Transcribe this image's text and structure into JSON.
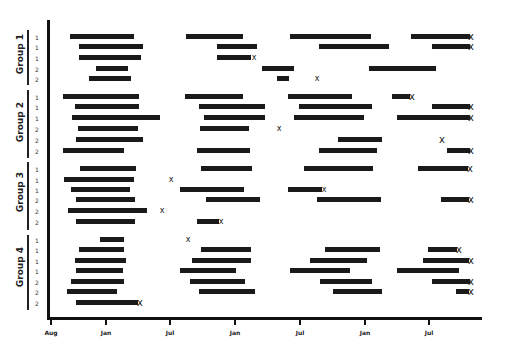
{
  "chart_data": {
    "type": "timeline",
    "title": "",
    "xlabel": "",
    "ylabel": "",
    "x_ticks": [
      {
        "label": "Aug",
        "x": 51
      },
      {
        "label": "Jan",
        "x": 106
      },
      {
        "label": "Jul",
        "x": 170
      },
      {
        "label": "Jan",
        "x": 235
      },
      {
        "label": "Jul",
        "x": 300
      },
      {
        "label": "Jan",
        "x": 365
      },
      {
        "label": "Jul",
        "x": 429
      }
    ],
    "legend": "bars = periods of observation/treatment; x = event (end of follow-up / death)",
    "groups": [
      {
        "label": "Group 1",
        "label_y": 55,
        "line": {
          "top": 30,
          "bottom": 85
        },
        "rows": [
          {
            "y": 37,
            "marker": "1",
            "bars": [
              [
                70,
                134
              ],
              [
                186,
                243
              ],
              [
                290,
                371
              ],
              [
                411,
                470
              ]
            ],
            "marks": [
              {
                "x": 471,
                "big": true
              }
            ]
          },
          {
            "y": 47,
            "marker": "1",
            "bars": [
              [
                79,
                143
              ],
              [
                217,
                257
              ],
              [
                319,
                389
              ],
              [
                432,
                470
              ]
            ],
            "marks": [
              {
                "x": 471,
                "big": true
              }
            ]
          },
          {
            "y": 58,
            "marker": "1",
            "bars": [
              [
                79,
                141
              ],
              [
                217,
                251
              ]
            ],
            "marks": [
              {
                "x": 254,
                "big": false
              }
            ]
          },
          {
            "y": 69,
            "marker": "2",
            "bars": [
              [
                96,
                128
              ],
              [
                262,
                294
              ],
              [
                369,
                436
              ]
            ],
            "marks": []
          },
          {
            "y": 79,
            "marker": "2",
            "bars": [
              [
                89,
                131
              ],
              [
                277,
                289
              ]
            ],
            "marks": [
              {
                "x": 317,
                "big": false
              }
            ]
          }
        ]
      },
      {
        "label": "Group 2",
        "label_y": 123,
        "line": {
          "top": 90,
          "bottom": 158
        },
        "rows": [
          {
            "y": 97,
            "marker": "1",
            "bars": [
              [
                63,
                139
              ],
              [
                185,
                243
              ],
              [
                288,
                352
              ],
              [
                392,
                410
              ]
            ],
            "marks": [
              {
                "x": 412,
                "big": true
              }
            ]
          },
          {
            "y": 107,
            "marker": "1",
            "bars": [
              [
                75,
                139
              ],
              [
                199,
                265
              ],
              [
                299,
                372
              ],
              [
                432,
                470
              ]
            ],
            "marks": [
              {
                "x": 471,
                "big": true
              }
            ]
          },
          {
            "y": 118,
            "marker": "1",
            "bars": [
              [
                72,
                160
              ],
              [
                204,
                265
              ],
              [
                294,
                364
              ],
              [
                397,
                470
              ]
            ],
            "marks": [
              {
                "x": 471,
                "big": true
              }
            ]
          },
          {
            "y": 129,
            "marker": "2",
            "bars": [
              [
                78,
                138
              ],
              [
                200,
                249
              ]
            ],
            "marks": [
              {
                "x": 279,
                "big": false
              }
            ]
          },
          {
            "y": 140,
            "marker": "2",
            "bars": [
              [
                76,
                143
              ],
              [
                338,
                382
              ]
            ],
            "marks": [
              {
                "x": 442,
                "big": true
              }
            ]
          },
          {
            "y": 151,
            "marker": "2",
            "bars": [
              [
                63,
                124
              ],
              [
                197,
                250
              ],
              [
                319,
                377
              ],
              [
                447,
                470
              ]
            ],
            "marks": [
              {
                "x": 471,
                "big": true
              }
            ]
          }
        ]
      },
      {
        "label": "Group 3",
        "label_y": 193,
        "line": {
          "top": 162,
          "bottom": 230
        },
        "rows": [
          {
            "y": 169,
            "marker": "1",
            "bars": [
              [
                80,
                136
              ],
              [
                201,
                252
              ],
              [
                304,
                373
              ],
              [
                418,
                468
              ]
            ],
            "marks": [
              {
                "x": 470,
                "big": true
              }
            ]
          },
          {
            "y": 180,
            "marker": "1",
            "bars": [
              [
                64,
                134
              ]
            ],
            "marks": [
              {
                "x": 171,
                "big": false
              }
            ]
          },
          {
            "y": 190,
            "marker": "1",
            "bars": [
              [
                71,
                130
              ],
              [
                180,
                244
              ],
              [
                288,
                322
              ]
            ],
            "marks": [
              {
                "x": 324,
                "big": false
              }
            ]
          },
          {
            "y": 200,
            "marker": "2",
            "bars": [
              [
                76,
                135
              ],
              [
                206,
                260
              ],
              [
                317,
                381
              ],
              [
                441,
                469
              ]
            ],
            "marks": [
              {
                "x": 471,
                "big": true
              }
            ]
          },
          {
            "y": 211,
            "marker": "2",
            "bars": [
              [
                68,
                147
              ]
            ],
            "marks": [
              {
                "x": 162,
                "big": false
              }
            ]
          },
          {
            "y": 222,
            "marker": "2",
            "bars": [
              [
                76,
                135
              ],
              [
                197,
                219
              ]
            ],
            "marks": [
              {
                "x": 221,
                "big": false
              }
            ]
          }
        ]
      },
      {
        "label": "Group 4",
        "label_y": 268,
        "line": {
          "top": 235,
          "bottom": 310
        },
        "rows": [
          {
            "y": 240,
            "marker": "1",
            "bars": [
              [
                100,
                124
              ]
            ],
            "marks": [
              {
                "x": 188,
                "big": false
              }
            ]
          },
          {
            "y": 250,
            "marker": "1",
            "bars": [
              [
                79,
                124
              ],
              [
                201,
                251
              ],
              [
                325,
                380
              ],
              [
                428,
                457
              ]
            ],
            "marks": [
              {
                "x": 459,
                "big": true
              }
            ]
          },
          {
            "y": 261,
            "marker": "1",
            "bars": [
              [
                75,
                126
              ],
              [
                192,
                251
              ],
              [
                310,
                367
              ],
              [
                423,
                469
              ]
            ],
            "marks": [
              {
                "x": 471,
                "big": true
              }
            ]
          },
          {
            "y": 271,
            "marker": "1",
            "bars": [
              [
                76,
                123
              ],
              [
                180,
                236
              ],
              [
                290,
                350
              ],
              [
                397,
                459
              ]
            ],
            "marks": []
          },
          {
            "y": 282,
            "marker": "2",
            "bars": [
              [
                71,
                124
              ],
              [
                190,
                245
              ],
              [
                320,
                372
              ],
              [
                432,
                470
              ]
            ],
            "marks": [
              {
                "x": 471,
                "big": true
              }
            ]
          },
          {
            "y": 292,
            "marker": "2",
            "bars": [
              [
                67,
                117
              ],
              [
                199,
                255
              ],
              [
                333,
                382
              ],
              [
                456,
                469
              ]
            ],
            "marks": [
              {
                "x": 471,
                "big": true
              }
            ]
          },
          {
            "y": 303,
            "marker": "2",
            "bars": [
              [
                76,
                138
              ]
            ],
            "marks": [
              {
                "x": 140,
                "big": true
              }
            ]
          }
        ]
      }
    ]
  },
  "axis": {
    "x_ticks": [
      "Aug",
      "Jan",
      "Jul",
      "Jan",
      "Jul",
      "Jan",
      "Jul"
    ]
  },
  "labels": {
    "group1": "Group 1",
    "group2": "Group 2",
    "group3": "Group 3",
    "group4": "Group 4"
  },
  "event_symbol": "x"
}
